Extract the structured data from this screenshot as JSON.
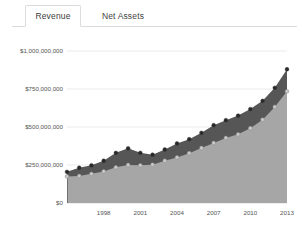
{
  "tabs": [
    {
      "label": "Revenue",
      "active": true
    },
    {
      "label": "Net Assets",
      "active": false
    }
  ],
  "chart_data": {
    "type": "area",
    "title": "",
    "xlabel": "",
    "ylabel": "",
    "stacked": false,
    "grid": true,
    "legend_position": "none",
    "ylim": [
      0,
      1000000000
    ],
    "ytick_labels": [
      "$1,000,000,000",
      "$750,000,000",
      "$500,000,000",
      "$250,000,000",
      "$0"
    ],
    "ytick_values": [
      1000000000,
      750000000,
      500000000,
      250000000,
      0
    ],
    "xtick_labels": [
      "1998",
      "2001",
      "2004",
      "2007",
      "2010",
      "2013"
    ],
    "xtick_values": [
      1998,
      2001,
      2004,
      2007,
      2010,
      2013
    ],
    "xlim": [
      1995,
      2013
    ],
    "x": [
      1995,
      1996,
      1997,
      1998,
      1999,
      2000,
      2001,
      2002,
      2003,
      2004,
      2005,
      2006,
      2007,
      2008,
      2009,
      2010,
      2011,
      2012,
      2013
    ],
    "series": [
      {
        "name": "Revenue",
        "color": "#565656",
        "marker": "filled-circle",
        "values": [
          205000000,
          232000000,
          248000000,
          278000000,
          330000000,
          360000000,
          330000000,
          318000000,
          352000000,
          392000000,
          420000000,
          462000000,
          512000000,
          545000000,
          575000000,
          618000000,
          672000000,
          758000000,
          880000000
        ]
      },
      {
        "name": "Net Assets",
        "color": "#a6a6a6",
        "marker": "open-circle",
        "values": [
          175000000,
          178000000,
          192000000,
          208000000,
          235000000,
          250000000,
          248000000,
          252000000,
          278000000,
          300000000,
          328000000,
          362000000,
          395000000,
          428000000,
          452000000,
          492000000,
          548000000,
          632000000,
          735000000
        ]
      }
    ]
  }
}
